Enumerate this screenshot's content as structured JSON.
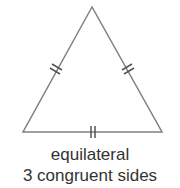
{
  "diagram": {
    "shape": "equilateral-triangle",
    "stroke_color": "#808080",
    "vertices": {
      "apex": [
        92,
        7
      ],
      "bottom_left": [
        23,
        132
      ],
      "bottom_right": [
        162,
        132
      ]
    },
    "tick_marks": {
      "per_side": 2,
      "sides": [
        "left",
        "right",
        "bottom"
      ]
    },
    "labels": {
      "title": "equilateral",
      "description": "3 congruent sides"
    }
  }
}
